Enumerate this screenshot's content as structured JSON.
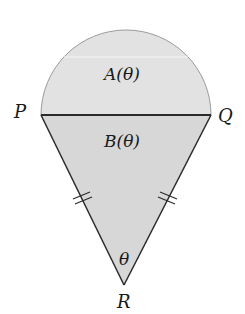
{
  "diagram": {
    "vertices": {
      "P": {
        "label": "P",
        "x": 41,
        "y": 115
      },
      "Q": {
        "label": "Q",
        "x": 211,
        "y": 115
      },
      "R": {
        "label": "R",
        "x": 124,
        "y": 285
      }
    },
    "regions": {
      "semicircle": {
        "label": "A(θ)",
        "fill": "#e2e2e2"
      },
      "triangle": {
        "label": "B(θ)",
        "fill": "#d7d7d7"
      }
    },
    "angle_label": "θ",
    "equal_side_marks": "double tick marks on PR and QR",
    "stroke_color": "#2a2a2a"
  }
}
